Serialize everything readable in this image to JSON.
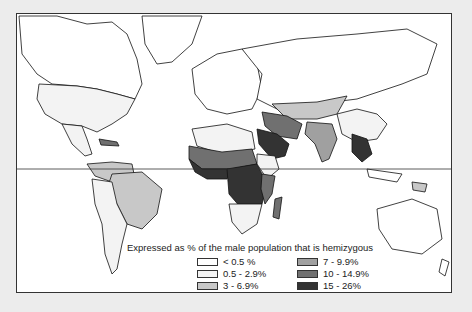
{
  "map": {
    "title": "Expressed as % of the male population that is hemizygous",
    "legend": [
      {
        "label": "< 0.5 %",
        "color": "#ffffff"
      },
      {
        "label": "0.5 - 2.9%",
        "color": "#f3f3f3"
      },
      {
        "label": "3 - 6.9%",
        "color": "#c8c8c8"
      },
      {
        "label": "7 - 9.9%",
        "color": "#a0a0a0"
      },
      {
        "label": "10 - 14.9%",
        "color": "#707070"
      },
      {
        "label": "15 - 26%",
        "color": "#333333"
      }
    ],
    "regions": [
      {
        "name": "North America",
        "category": "0.5 - 2.9%"
      },
      {
        "name": "Canada",
        "category": "< 0.5 %"
      },
      {
        "name": "Greenland",
        "category": "< 0.5 %"
      },
      {
        "name": "Europe",
        "category": "< 0.5 %"
      },
      {
        "name": "Russia / Northern Asia",
        "category": "< 0.5 %"
      },
      {
        "name": "Central Asia",
        "category": "3 - 6.9%"
      },
      {
        "name": "China",
        "category": "0.5 - 2.9%"
      },
      {
        "name": "India",
        "category": "7 - 9.9%"
      },
      {
        "name": "Arabian Peninsula",
        "category": "15 - 26%"
      },
      {
        "name": "Iran",
        "category": "10 - 14.9%"
      },
      {
        "name": "Southeast Asia",
        "category": "15 - 26%"
      },
      {
        "name": "North Africa",
        "category": "0.5 - 2.9%"
      },
      {
        "name": "Sahel",
        "category": "10 - 14.9%"
      },
      {
        "name": "West Africa",
        "category": "15 - 26%"
      },
      {
        "name": "Central Africa",
        "category": "15 - 26%"
      },
      {
        "name": "East Africa",
        "category": "10 - 14.9%"
      },
      {
        "name": "Horn of Africa",
        "category": "0.5 - 2.9%"
      },
      {
        "name": "Southern Africa",
        "category": "0.5 - 2.9%"
      },
      {
        "name": "Madagascar",
        "category": "10 - 14.9%"
      },
      {
        "name": "Brazil",
        "category": "3 - 6.9%"
      },
      {
        "name": "Andes / Southern South America",
        "category": "0.5 - 2.9%"
      },
      {
        "name": "Caribbean",
        "category": "10 - 14.9%"
      },
      {
        "name": "Australia",
        "category": "< 0.5 %"
      },
      {
        "name": "Papua New Guinea",
        "category": "3 - 6.9%"
      }
    ],
    "equator_label": ""
  }
}
